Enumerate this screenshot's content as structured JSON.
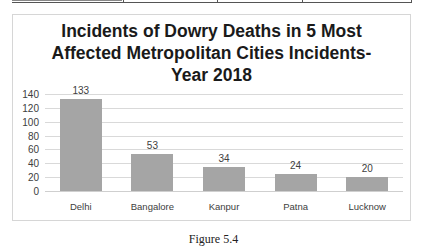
{
  "chart_data": {
    "type": "bar",
    "title_lines": [
      "Incidents of Dowry Deaths in 5 Most",
      "Affected Metropolitan Cities Incidents-",
      "Year 2018"
    ],
    "categories": [
      "Delhi",
      "Bangalore",
      "Kanpur",
      "Patna",
      "Lucknow"
    ],
    "values": [
      133,
      53,
      34,
      24,
      20
    ],
    "data_labels": [
      "133",
      "53",
      "34",
      "24",
      "20"
    ],
    "xlabel": "",
    "ylabel": "",
    "ylim": [
      0,
      140
    ],
    "yticks": [
      "0",
      "20",
      "40",
      "60",
      "80",
      "100",
      "120",
      "140"
    ],
    "grid": true,
    "legend": "none",
    "bar_color": "#a5a5a5"
  },
  "caption": "Figure 5.4"
}
